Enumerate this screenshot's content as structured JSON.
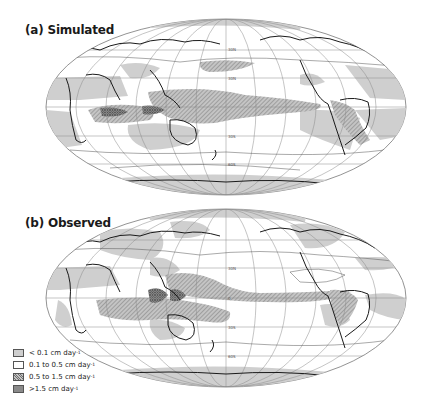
{
  "figure": {
    "panels": [
      {
        "id": "a",
        "letter": "(a)",
        "title": "Simulated"
      },
      {
        "id": "b",
        "letter": "(b)",
        "title": "Observed"
      }
    ],
    "graticule_labels": [
      "30N",
      "0",
      "30S",
      "60S"
    ],
    "contour_labels": [
      "1",
      "2"
    ]
  },
  "legend": {
    "items": [
      {
        "label": "< 0.1 cm day",
        "unit_exp": "-1",
        "fill": "#cfcfcf",
        "pattern": "solid-light"
      },
      {
        "label": "0.1 to 0.5 cm day",
        "unit_exp": "-1",
        "fill": "#ffffff",
        "pattern": "none"
      },
      {
        "label": "0.5 to 1.5 cm day",
        "unit_exp": "-1",
        "fill": "#b8b8b8",
        "pattern": "fine-hatch"
      },
      {
        "label": ">1.5 cm day",
        "unit_exp": "-1",
        "fill": "#8a8a8a",
        "pattern": "dense-crosshatch"
      }
    ]
  },
  "colors": {
    "light_gray": "#cfcfcf",
    "medium_hatch": "#b0b0b0",
    "dark_hatch": "#7a7a7a",
    "coastline": "#1a1a1a",
    "graticule": "#8a8a8a"
  }
}
